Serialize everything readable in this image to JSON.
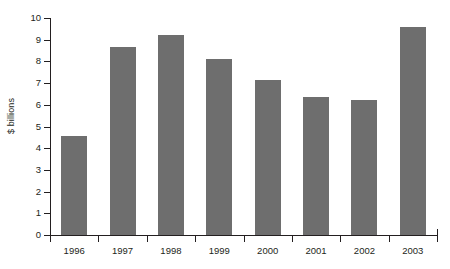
{
  "chart_data": {
    "type": "bar",
    "title": "",
    "subtitle": "",
    "xlabel": "",
    "ylabel": "$ billions",
    "categories": [
      "1996",
      "1997",
      "1998",
      "1999",
      "2000",
      "2001",
      "2002",
      "2003"
    ],
    "values": [
      4.55,
      8.65,
      9.2,
      8.1,
      7.15,
      6.35,
      6.2,
      9.6
    ],
    "series": [
      {
        "name": "",
        "values": [
          4.55,
          8.65,
          9.2,
          8.1,
          7.15,
          6.35,
          6.2,
          9.6
        ]
      }
    ],
    "ylim": [
      0,
      10
    ],
    "y_ticks": [
      "0",
      "1",
      "2",
      "3",
      "4",
      "5",
      "6",
      "7",
      "8",
      "9",
      "10"
    ],
    "y_tick_values": [
      0,
      1,
      2,
      3,
      4,
      5,
      6,
      7,
      8,
      9,
      10
    ],
    "grid": false,
    "legend": false,
    "legend_position": "none",
    "bar_color": "#6e6e6e",
    "axis_color": "#231f20",
    "background_color": "#ffffff"
  }
}
